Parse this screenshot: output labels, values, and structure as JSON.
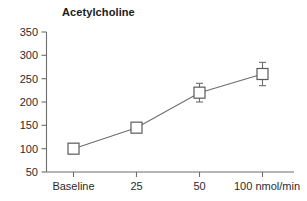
{
  "chart_data": {
    "type": "line",
    "title": "Acetylcholine",
    "xlabel": "",
    "ylabel": "",
    "categories": [
      "Baseline",
      "25",
      "50",
      "100 nmol/min"
    ],
    "values": [
      100,
      145,
      220,
      260
    ],
    "errors": [
      0,
      5,
      20,
      25
    ],
    "series": [
      {
        "name": "Acetylcholine",
        "values": [
          100,
          145,
          220,
          260
        ],
        "errors": [
          0,
          5,
          20,
          25
        ]
      }
    ],
    "ylim": [
      50,
      350
    ],
    "yticks": [
      50,
      100,
      150,
      200,
      250,
      300,
      350
    ],
    "ytick_labels": [
      "50",
      "100",
      "150",
      "200",
      "250",
      "300",
      "350"
    ],
    "xtick_labels": [
      "Baseline",
      "25",
      "50",
      "100 nmol/min"
    ],
    "grid": false,
    "legend": false,
    "legend_position": "none",
    "marker": "open-square",
    "line_color": "#6d6d6d",
    "marker_fill": "#ffffff",
    "marker_stroke": "#5a5a5a",
    "background": "#ffffff"
  }
}
